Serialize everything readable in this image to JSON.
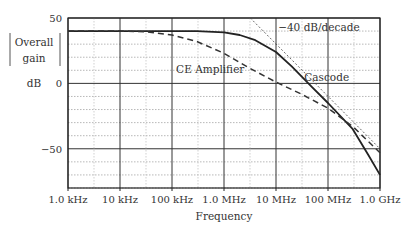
{
  "chart_data": {
    "type": "line",
    "title": "",
    "xlabel": "Frequency",
    "ylabel": "Overall gain dB",
    "ylabel_lines": [
      "Overall",
      "gain",
      "dB"
    ],
    "xscale": "log",
    "x_ticks": [
      1000.0,
      10000.0,
      100000.0,
      1000000.0,
      10000000.0,
      100000000.0,
      1000000000.0
    ],
    "x_tick_labels": [
      "1.0 kHz",
      "10 kHz",
      "100 kHz",
      "1.0 MHz",
      "10 MHz",
      "100 MHz",
      "1.0 GHz"
    ],
    "y_ticks": [
      50,
      0,
      -50
    ],
    "y_tick_labels": [
      "50",
      "0",
      "−50"
    ],
    "ylim": [
      -80,
      50
    ],
    "xlim": [
      1000.0,
      1000000000.0
    ],
    "grid": true,
    "series": [
      {
        "name": "Cascode",
        "style": "solid",
        "x": [
          1000.0,
          10000.0,
          100000.0,
          300000.0,
          1000000.0,
          2000000.0,
          4000000.0,
          10000000.0,
          20000000.0,
          50000000.0,
          100000000.0,
          300000000.0,
          600000000.0,
          1000000000.0
        ],
        "values": [
          40,
          40,
          40,
          40,
          39,
          37,
          33,
          24,
          13,
          -3,
          -15,
          -35,
          -55,
          -70
        ]
      },
      {
        "name": "CE Amplifier",
        "style": "dashed",
        "x": [
          1000.0,
          10000.0,
          30000.0,
          100000.0,
          300000.0,
          1000000.0,
          3000000.0,
          10000000.0,
          30000000.0,
          100000000.0,
          300000000.0,
          1000000000.0
        ],
        "values": [
          40,
          40,
          39.5,
          37,
          32,
          23,
          12,
          1,
          -8,
          -19,
          -33,
          -53
        ]
      },
      {
        "name": "-40 dB/decade asymptote",
        "style": "dotted",
        "x": [
          3200000.0,
          1000000000.0
        ],
        "values": [
          50,
          -50
        ]
      }
    ],
    "annotations": [
      {
        "text": "−40 dB/decade",
        "x": 11000000.0,
        "y": 40
      },
      {
        "text": "CE Amplifier",
        "x": 120000.0,
        "y": 8
      },
      {
        "text": "Cascode",
        "x": 35000000.0,
        "y": 2
      }
    ]
  }
}
